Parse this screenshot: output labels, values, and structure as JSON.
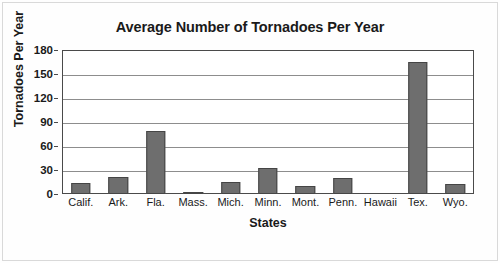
{
  "chart_data": {
    "type": "bar",
    "title": "Average Number of Tornadoes Per Year",
    "xlabel": "States",
    "ylabel": "Tornadoes Per Year",
    "categories": [
      "Calif.",
      "Ark.",
      "Fla.",
      "Mass.",
      "Mich.",
      "Minn.",
      "Mont.",
      "Penn.",
      "Hawaii",
      "Tex.",
      "Wyo."
    ],
    "values": [
      14,
      21,
      79,
      2,
      15,
      33,
      10,
      20,
      0,
      165,
      12
    ],
    "ylim": [
      0,
      180
    ],
    "yticks": [
      0,
      30,
      60,
      90,
      120,
      150,
      180
    ],
    "ytick_labels": [
      "0",
      "30",
      "60",
      "90",
      "120",
      "150",
      "180"
    ],
    "grid": true,
    "legend": false,
    "bar_color": "#6e6e6e",
    "bar_edge_color": "#454545",
    "axis_color": "#4a4a4a",
    "grid_color": "#8d8d8d",
    "text_color": "#1a1a1a",
    "background": "#ffffff"
  }
}
